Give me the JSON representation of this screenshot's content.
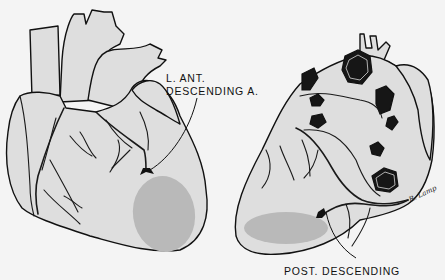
{
  "figure": {
    "labels": {
      "lad_line1": "L. ANT.",
      "lad_line2": "DESCENDING A.",
      "pda": "POST. DESCENDING"
    },
    "signature": "R. Lamp",
    "colors": {
      "background": "#f4f4f4",
      "heart_fill": "#dedede",
      "infarct_fill": "#b9b9b9",
      "line": "#111111"
    },
    "views": [
      {
        "name": "anterior",
        "occluded_artery": "L. ANT. DESCENDING A.",
        "infarct_region": "anterior apex"
      },
      {
        "name": "posterior",
        "occluded_artery": "POST. DESCENDING",
        "infarct_region": "inferior wall"
      }
    ]
  }
}
